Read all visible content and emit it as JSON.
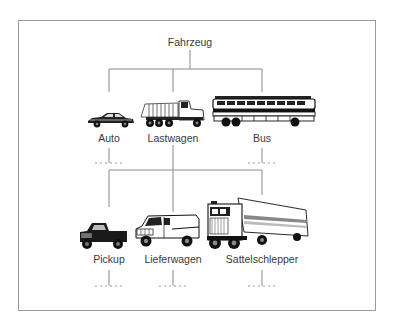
{
  "diagram": {
    "root": {
      "label": "Fahrzeug"
    },
    "level1": [
      {
        "label": "Auto",
        "icon": "car-icon"
      },
      {
        "label": "Lastwagen",
        "icon": "dump-truck-icon"
      },
      {
        "label": "Bus",
        "icon": "bus-icon"
      }
    ],
    "level2": [
      {
        "label": "Pickup",
        "icon": "pickup-truck-icon"
      },
      {
        "label": "Lieferwagen",
        "icon": "van-icon"
      },
      {
        "label": "Sattelschlepper",
        "icon": "semi-truck-icon"
      }
    ],
    "colors": {
      "line": "#8a8a8a",
      "frame": "#9a9a9a",
      "text": "#3a3a3a",
      "ink": "#111111"
    }
  }
}
